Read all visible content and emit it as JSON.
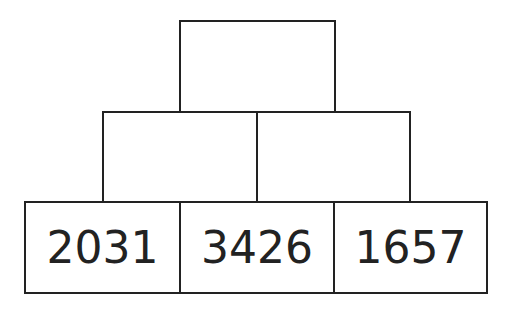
{
  "pyramid": {
    "top": [
      ""
    ],
    "middle": [
      "",
      ""
    ],
    "bottom": [
      "2031",
      "3426",
      "1657"
    ]
  },
  "colors": {
    "line": "#222222",
    "background": "#ffffff"
  }
}
